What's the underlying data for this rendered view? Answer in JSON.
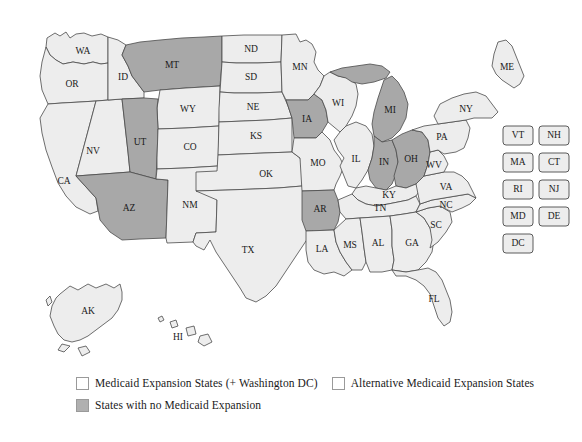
{
  "figure": {
    "caption_text": ""
  },
  "colors": {
    "expansion_fill": "#ededed",
    "no_expansion_fill": "#a8a8a8",
    "border": "#4a4a4a",
    "background": "#ffffff"
  },
  "legend": {
    "items": [
      {
        "key": "expansion",
        "swatch": "light",
        "label": "Medicaid Expansion States (+ Washington DC)"
      },
      {
        "key": "alternative",
        "swatch": "light",
        "label": "Alternative Medicaid Expansion States"
      },
      {
        "key": "none",
        "swatch": "dark",
        "label": "States with no Medicaid Expansion"
      }
    ]
  },
  "map": {
    "states": [
      {
        "abbr": "WA",
        "status": "expansion"
      },
      {
        "abbr": "OR",
        "status": "expansion"
      },
      {
        "abbr": "CA",
        "status": "expansion"
      },
      {
        "abbr": "NV",
        "status": "expansion"
      },
      {
        "abbr": "ID",
        "status": "expansion"
      },
      {
        "abbr": "MT",
        "status": "none"
      },
      {
        "abbr": "WY",
        "status": "expansion"
      },
      {
        "abbr": "UT",
        "status": "none"
      },
      {
        "abbr": "AZ",
        "status": "none"
      },
      {
        "abbr": "CO",
        "status": "expansion"
      },
      {
        "abbr": "NM",
        "status": "expansion"
      },
      {
        "abbr": "ND",
        "status": "expansion"
      },
      {
        "abbr": "SD",
        "status": "expansion"
      },
      {
        "abbr": "NE",
        "status": "expansion"
      },
      {
        "abbr": "KS",
        "status": "expansion"
      },
      {
        "abbr": "OK",
        "status": "expansion"
      },
      {
        "abbr": "TX",
        "status": "expansion"
      },
      {
        "abbr": "MN",
        "status": "expansion"
      },
      {
        "abbr": "IA",
        "status": "none"
      },
      {
        "abbr": "MO",
        "status": "expansion"
      },
      {
        "abbr": "AR",
        "status": "none"
      },
      {
        "abbr": "LA",
        "status": "expansion"
      },
      {
        "abbr": "WI",
        "status": "expansion"
      },
      {
        "abbr": "IL",
        "status": "expansion"
      },
      {
        "abbr": "MI",
        "status": "none"
      },
      {
        "abbr": "IN",
        "status": "none"
      },
      {
        "abbr": "OH",
        "status": "none"
      },
      {
        "abbr": "KY",
        "status": "expansion"
      },
      {
        "abbr": "TN",
        "status": "expansion"
      },
      {
        "abbr": "MS",
        "status": "expansion"
      },
      {
        "abbr": "AL",
        "status": "expansion"
      },
      {
        "abbr": "GA",
        "status": "expansion"
      },
      {
        "abbr": "FL",
        "status": "expansion"
      },
      {
        "abbr": "SC",
        "status": "expansion"
      },
      {
        "abbr": "NC",
        "status": "expansion"
      },
      {
        "abbr": "VA",
        "status": "expansion"
      },
      {
        "abbr": "WV",
        "status": "expansion"
      },
      {
        "abbr": "PA",
        "status": "expansion"
      },
      {
        "abbr": "NY",
        "status": "expansion"
      },
      {
        "abbr": "ME",
        "status": "expansion"
      },
      {
        "abbr": "AK",
        "status": "expansion"
      },
      {
        "abbr": "HI",
        "status": "expansion"
      }
    ],
    "inset_boxes": [
      {
        "abbr": "VT",
        "status": "expansion"
      },
      {
        "abbr": "NH",
        "status": "expansion"
      },
      {
        "abbr": "MA",
        "status": "expansion"
      },
      {
        "abbr": "CT",
        "status": "expansion"
      },
      {
        "abbr": "RI",
        "status": "expansion"
      },
      {
        "abbr": "NJ",
        "status": "expansion"
      },
      {
        "abbr": "MD",
        "status": "expansion"
      },
      {
        "abbr": "DE",
        "status": "expansion"
      },
      {
        "abbr": "DC",
        "status": "expansion"
      }
    ]
  }
}
